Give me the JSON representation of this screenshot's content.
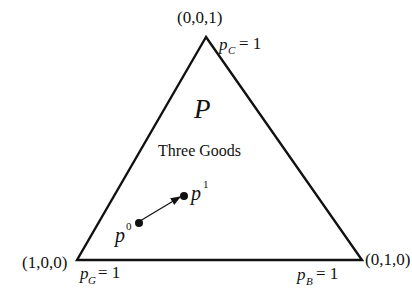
{
  "diagram": {
    "title_symbol": "P",
    "subtitle": "Three Goods",
    "vertices": {
      "top": {
        "coord_label": "(0,0,1)",
        "price_var": "p",
        "price_sub": "C",
        "price_eq": "= 1"
      },
      "bottom_left": {
        "coord_label": "(1,0,0)",
        "price_var": "p",
        "price_sub": "G",
        "price_eq": "= 1"
      },
      "bottom_right": {
        "coord_label": "(0,1,0)",
        "price_var": "p",
        "price_sub": "B",
        "price_eq": "= 1"
      }
    },
    "points": [
      {
        "name": "p",
        "sup": "0"
      },
      {
        "name": "p",
        "sup": "1"
      }
    ],
    "colors": {
      "line": "#111111",
      "background": "#ffffff"
    }
  }
}
